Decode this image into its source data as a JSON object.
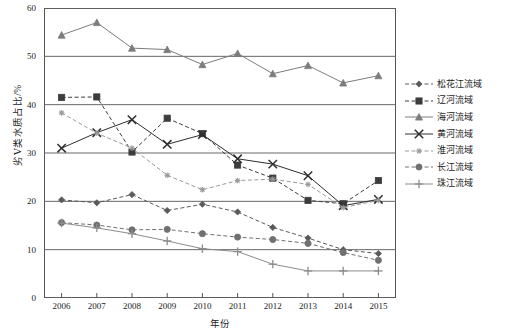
{
  "chart_data": {
    "type": "line",
    "title": "",
    "xlabel": "年份",
    "ylabel": "劣Ⅴ类水质占比/%",
    "x": [
      2006,
      2007,
      2008,
      2009,
      2010,
      2011,
      2012,
      2013,
      2014,
      2015
    ],
    "xtick_labels": [
      "2006",
      "2007",
      "2008",
      "2009",
      "2010",
      "2011",
      "2012",
      "2013",
      "2014",
      "2015"
    ],
    "ytick_labels": [
      "0",
      "10",
      "20",
      "30",
      "40",
      "50",
      "60"
    ],
    "yticks": [
      0,
      10,
      20,
      30,
      40,
      50,
      60
    ],
    "ylim": [
      0,
      60
    ],
    "xlim": [
      2006,
      2015
    ],
    "grid": "horizontal",
    "legend_position": "right",
    "series": [
      {
        "name": "松花江流域",
        "values": [
          20.3,
          19.7,
          21.4,
          18.1,
          19.4,
          17.8,
          14.6,
          12.4,
          10.0,
          9.2
        ],
        "color": "#5a5a5a",
        "marker": "diamond",
        "dash": "dashed"
      },
      {
        "name": "辽河流域",
        "values": [
          41.5,
          41.6,
          30.2,
          37.2,
          34.0,
          27.5,
          24.8,
          20.2,
          19.5,
          24.3
        ],
        "color": "#3c3c3c",
        "marker": "square",
        "dash": "dashed"
      },
      {
        "name": "海河流域",
        "values": [
          54.4,
          57.0,
          51.7,
          51.4,
          48.3,
          50.6,
          46.4,
          48.1,
          44.5,
          46.0
        ],
        "color": "#7c7c7c",
        "marker": "triangle",
        "dash": "solid"
      },
      {
        "name": "黄河流域",
        "values": [
          31.0,
          34.2,
          36.9,
          31.8,
          33.8,
          28.8,
          27.7,
          25.3,
          19.1,
          20.4
        ],
        "color": "#2e2e2e",
        "marker": "cross",
        "dash": "solid"
      },
      {
        "name": "淮河流域",
        "values": [
          38.3,
          34.1,
          31.0,
          25.4,
          22.4,
          24.3,
          24.6,
          23.5,
          18.7,
          20.2
        ],
        "color": "#9a9a9a",
        "marker": "asterisk",
        "dash": "dashed"
      },
      {
        "name": "长江流域",
        "values": [
          15.6,
          15.1,
          14.1,
          14.2,
          13.3,
          12.6,
          12.1,
          11.3,
          9.4,
          7.8
        ],
        "color": "#707070",
        "marker": "circle",
        "dash": "dashed"
      },
      {
        "name": "珠江流域",
        "values": [
          15.5,
          14.5,
          13.3,
          11.8,
          10.2,
          9.6,
          7.0,
          5.6,
          5.6,
          5.6
        ],
        "color": "#8c8c8c",
        "marker": "plus",
        "dash": "solid"
      }
    ]
  }
}
